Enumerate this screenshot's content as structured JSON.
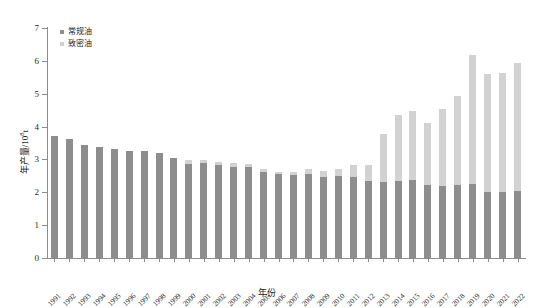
{
  "chart_data": {
    "type": "bar",
    "stacked": true,
    "title": "",
    "xlabel": "年份",
    "ylabel": "年产量/10⁸t",
    "ylim": [
      0,
      7
    ],
    "yticks": [
      0,
      1,
      2,
      3,
      4,
      5,
      6,
      7
    ],
    "grid": false,
    "legend_position": "top-left",
    "categories": [
      "1991",
      "1992",
      "1993",
      "1994",
      "1995",
      "1996",
      "1997",
      "1998",
      "1999",
      "2000",
      "2001",
      "2002",
      "2003",
      "2004",
      "2005",
      "2006",
      "2007",
      "2008",
      "2009",
      "2010",
      "2011",
      "2012",
      "2013",
      "2014",
      "2015",
      "2016",
      "2017",
      "2018",
      "2019",
      "2020",
      "2021",
      "2022"
    ],
    "series": [
      {
        "name": "常规油",
        "color": "#8d8d8d",
        "values": [
          3.7,
          3.62,
          3.45,
          3.38,
          3.32,
          3.26,
          3.25,
          3.2,
          3.05,
          2.86,
          2.9,
          2.82,
          2.78,
          2.76,
          2.63,
          2.55,
          2.52,
          2.55,
          2.48,
          2.5,
          2.46,
          2.35,
          2.3,
          2.34,
          2.38,
          2.22,
          2.2,
          2.22,
          2.25,
          2.02,
          2.02,
          2.05
        ]
      },
      {
        "name": "致密油",
        "color": "#d2d2d2",
        "values": [
          0.0,
          0.0,
          0.0,
          0.0,
          0.0,
          0.0,
          0.0,
          0.0,
          0.0,
          0.12,
          0.08,
          0.1,
          0.12,
          0.1,
          0.08,
          0.07,
          0.1,
          0.15,
          0.16,
          0.2,
          0.38,
          0.48,
          1.48,
          2.02,
          2.08,
          1.88,
          2.34,
          2.72,
          3.92,
          3.58,
          3.6,
          3.9
        ]
      }
    ]
  },
  "legend": {
    "items": [
      {
        "label": "常规油",
        "color": "#8d8d8d"
      },
      {
        "label": "致密油",
        "color": "#d2d2d2"
      }
    ]
  },
  "axes": {
    "x_title": "年份",
    "y_title_main": "年产量/10",
    "y_title_sup": "8",
    "y_title_unit": "t"
  }
}
